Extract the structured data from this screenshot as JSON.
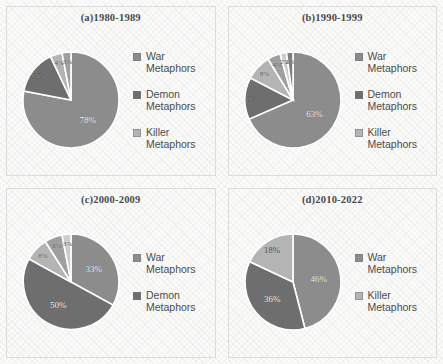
{
  "figure": {
    "palette": {
      "war": "#8c8c8c",
      "demon": "#6e6e6e",
      "killer": "#b4b4b4",
      "extra1": "#9f9f9f",
      "extra2": "#cdcdcd",
      "extra3": "#7d7d7d",
      "gap": "#ffffff"
    }
  },
  "chart_data": [
    {
      "type": "pie",
      "id": "panel-a",
      "title": "(a)1980-1989",
      "labels": [
        "War Metaphors",
        "Demon Metaphors",
        "Killer Metaphors",
        "Other",
        "Other"
      ],
      "values": [
        78,
        15,
        4,
        3,
        0
      ],
      "display_values": [
        "78%",
        "15%",
        "4%",
        "3%",
        ""
      ],
      "legend": [
        "War Metaphors",
        "Demon Metaphors",
        "Killer Metaphors"
      ],
      "legend_position": "right"
    },
    {
      "type": "pie",
      "id": "panel-b",
      "title": "(b)1990-1999",
      "labels": [
        "War Metaphors",
        "Demon Metaphors",
        "Killer Metaphors",
        "Other",
        "Other",
        "Other"
      ],
      "values": [
        63,
        13,
        8,
        4,
        2,
        2
      ],
      "display_values": [
        "63%",
        "13%",
        "8%",
        "4%",
        "2%",
        "2%"
      ],
      "legend": [
        "War Metaphors",
        "Demon Metaphors",
        "Killer Metaphors"
      ],
      "legend_position": "right"
    },
    {
      "type": "pie",
      "id": "panel-c",
      "title": "(c)2000-2009",
      "labels": [
        "War Metaphors",
        "Demon Metaphors",
        "Killer Metaphors",
        "Other",
        "Other"
      ],
      "values": [
        33,
        50,
        8,
        6,
        3
      ],
      "display_values": [
        "33%",
        "50%",
        "8%",
        "6%",
        "3%"
      ],
      "legend": [
        "War Metaphors",
        "Demon Metaphors"
      ],
      "legend_position": "right"
    },
    {
      "type": "pie",
      "id": "panel-d",
      "title": "(d)2010-2022",
      "labels": [
        "War Metaphors",
        "Killer Metaphors",
        "Demon Metaphors"
      ],
      "values": [
        46,
        36,
        18
      ],
      "display_values": [
        "46%",
        "36%",
        "18%"
      ],
      "legend": [
        "War Metaphors",
        "Killer Metaphors"
      ],
      "legend_position": "right"
    }
  ]
}
